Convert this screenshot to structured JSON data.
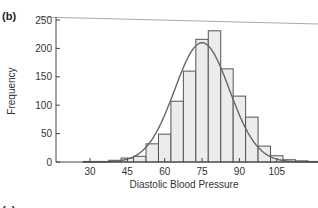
{
  "panel_label": "(b)",
  "next_panel_label": "(c)",
  "next_panel_tick": "150",
  "chart_data": {
    "type": "bar",
    "title": "",
    "xlabel": "Diastolic Blood Pressure",
    "ylabel": "Frequency",
    "xlim": [
      20,
      122
    ],
    "ylim": [
      0,
      250
    ],
    "xticks": [
      30,
      45,
      60,
      75,
      90,
      105
    ],
    "yticks": [
      0,
      50,
      100,
      150,
      200,
      250
    ],
    "bin_width": 5,
    "bin_centers": [
      30,
      35,
      40,
      45,
      50,
      55,
      60,
      65,
      70,
      75,
      80,
      85,
      90,
      95,
      100,
      105,
      110,
      115,
      120
    ],
    "values": [
      1,
      1,
      3,
      7,
      10,
      32,
      49,
      107,
      160,
      216,
      231,
      164,
      116,
      79,
      28,
      11,
      4,
      2,
      1
    ],
    "overlay": {
      "type": "normal_curve",
      "mean": 75,
      "sd": 11,
      "peak": 210
    },
    "colors": {
      "bar_fill": "#ececec",
      "bar_edge": "#555555",
      "curve": "#666666",
      "axis": "#444444"
    }
  }
}
